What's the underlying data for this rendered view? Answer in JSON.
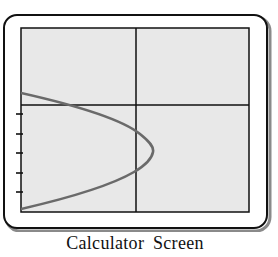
{
  "caption": "Calculator Screen",
  "colors": {
    "frame_border": "#111111",
    "frame_shadow": "#8a8a8a",
    "frame_fill": "#ffffff",
    "screen_fill": "#e8e8e8",
    "screen_border": "#111111",
    "axes": "#111111",
    "curve": "#6a6a6a",
    "ticks": "#111111"
  },
  "graph": {
    "type": "parametric_curve",
    "description": "Sideways parabola opening to the left on a graphing calculator display",
    "axes": {
      "x_axis_position": "upper portion of screen",
      "y_axis_position": "center-right of screen"
    },
    "left_edge_tick_count": 5,
    "curve": {
      "shape": "parabola opening left",
      "vertex_location": "right of y-axis, below x-axis",
      "crosses_y_axis_twice": true,
      "crosses_x_axis_once": true
    }
  }
}
